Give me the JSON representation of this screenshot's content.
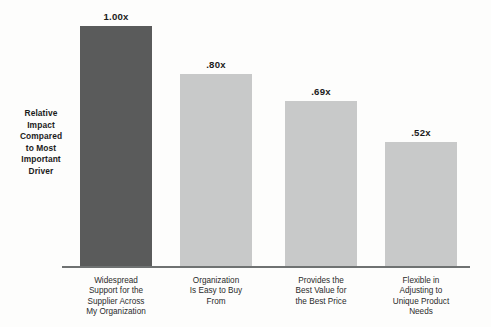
{
  "chart_data": {
    "type": "bar",
    "title": "",
    "xlabel": "",
    "ylabel": "Relative Impact Compared to Most Important Driver",
    "ylim": [
      0,
      1.0
    ],
    "grid": false,
    "legend": "none",
    "categories": [
      "Widespread Support for the Supplier Across My Organization",
      "Organization Is Easy to Buy From",
      "Provides the Best Value for the Best Price",
      "Flexible in Adjusting to Unique Product Needs"
    ],
    "values": [
      1.0,
      0.8,
      0.69,
      0.52
    ],
    "value_labels": [
      "1.00x",
      ".80x",
      ".69x",
      ".52x"
    ],
    "bar_colors": [
      "#5a5b5b",
      "#c8c9c9",
      "#c8c9c9",
      "#c8c9c9"
    ]
  },
  "axis": {
    "y_title_lines": [
      "Relative",
      "Impact",
      "Compared",
      "to Most",
      "Important",
      "Driver"
    ],
    "line_color": "#6f7272"
  },
  "bars": [
    {
      "value_label": "1.00x",
      "category_lines": [
        "Widespread",
        "Support for the",
        "Supplier Across",
        "My Organization"
      ]
    },
    {
      "value_label": ".80x",
      "category_lines": [
        "Organization",
        "Is Easy to Buy",
        "From"
      ]
    },
    {
      "value_label": ".69x",
      "category_lines": [
        "Provides the",
        "Best Value for",
        "the Best Price"
      ]
    },
    {
      "value_label": ".52x",
      "category_lines": [
        "Flexible in",
        "Adjusting to",
        "Unique Product",
        "Needs"
      ]
    }
  ]
}
